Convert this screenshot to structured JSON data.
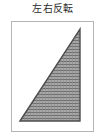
{
  "figure": {
    "caption": "左右反転",
    "caption_language": "ja",
    "background_color": "#ffffff",
    "frame": {
      "name": "figure-border",
      "border_color": "#b5b5b5",
      "fill_color": "#ffffff",
      "x": 11,
      "y": 21,
      "width": 83,
      "height": 111
    },
    "shape": {
      "name": "right-triangle",
      "type": "polygon",
      "description": "right triangle, right angle at bottom-right, hypotenuse rising from bottom-left to top-right",
      "outline_color": "#4d4d4d",
      "fill_pattern": "fine-gray-crosshatch",
      "fill_base_color": "#a8a8a8",
      "fill_line_color": "#6e6e6e",
      "vertices": [
        {
          "label": "bottom-left",
          "x": 8,
          "y": 99
        },
        {
          "label": "top-right",
          "x": 68,
          "y": 7
        },
        {
          "label": "bottom-right",
          "x": 68,
          "y": 99
        }
      ]
    }
  }
}
